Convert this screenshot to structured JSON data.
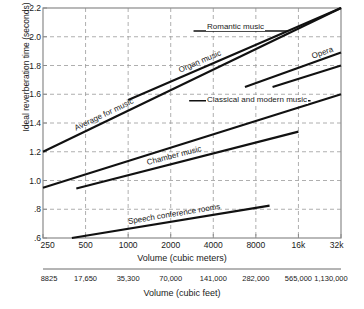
{
  "chart_data": {
    "type": "line",
    "title": "",
    "xlabel": "Volume (cubic meters)",
    "xlabel_secondary": "Volume (cubic feet)",
    "ylabel": "Ideal reverberation time (seconds)",
    "xscale": "log2",
    "xlim": [
      250,
      32000
    ],
    "ylim": [
      0.6,
      2.2
    ],
    "grid": true,
    "legend_position": "inline-labels",
    "xticks": [
      "250",
      "500",
      "1000",
      "2000",
      "4000",
      "8000",
      "16k",
      "32k"
    ],
    "xticks_values": [
      250,
      500,
      1000,
      2000,
      4000,
      8000,
      16000,
      32000
    ],
    "xticks_feet": [
      "8825",
      "17,650",
      "35,300",
      "70,000",
      "141,000",
      "282,000",
      "565,000",
      "1,130,000"
    ],
    "yticks": [
      "2.2",
      "2.0",
      "1.8",
      "1.6",
      "1.4",
      "1.2",
      "1.0",
      ".8",
      ".6"
    ],
    "yticks_values": [
      2.2,
      2.0,
      1.8,
      1.6,
      1.4,
      1.2,
      1.0,
      0.8,
      0.6
    ],
    "series": [
      {
        "name": "Romantic music",
        "kind": "trend-line",
        "label": "Romantic music",
        "x": [
          1000,
          32000
        ],
        "y": [
          1.56,
          2.2
        ],
        "range_bar": {
          "x": [
            2900,
            13500
          ],
          "y": 2.04
        }
      },
      {
        "name": "Opera",
        "kind": "trend-line",
        "label": "Opera",
        "x": [
          6700,
          32000
        ],
        "y": [
          1.65,
          1.89
        ]
      },
      {
        "name": "Opera lower",
        "kind": "trend-line",
        "label": "",
        "x": [
          10500,
          32000
        ],
        "y": [
          1.65,
          1.8
        ]
      },
      {
        "name": "Classical and modern music",
        "kind": "trend-line",
        "label": "Classical and modern music",
        "x": [
          250,
          32000
        ],
        "y": [
          0.95,
          1.6
        ],
        "range_bar": {
          "x": [
            2700,
            19500
          ],
          "y": 1.555
        }
      },
      {
        "name": "Average for music",
        "kind": "trend-line",
        "label": "Average for music",
        "x": [
          250,
          32000
        ],
        "y": [
          1.2,
          2.2
        ]
      },
      {
        "name": "Chamber music",
        "kind": "trend-line",
        "label": "Chamber music",
        "x": [
          430,
          16000
        ],
        "y": [
          0.945,
          1.34
        ]
      },
      {
        "name": "Speech conference rooms",
        "kind": "trend-line",
        "label": "Speech conference rooms",
        "x": [
          400,
          10000
        ],
        "y": [
          0.6,
          0.825
        ]
      }
    ],
    "colors": {
      "line": "#111111",
      "grid": "#9a9a9a",
      "axis": "#8a8a8a",
      "text": "#1a1a1a"
    }
  }
}
